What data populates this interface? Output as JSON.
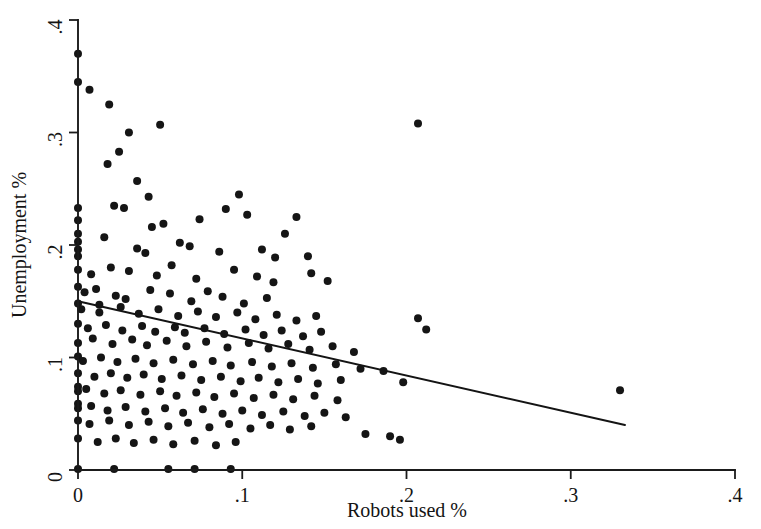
{
  "chart_data": {
    "type": "scatter",
    "title": "",
    "xlabel": "Robots used %",
    "ylabel": "Unemployment %",
    "xlim": [
      0,
      0.4
    ],
    "ylim": [
      0,
      0.4
    ],
    "xticks": [
      0,
      0.1,
      0.2,
      0.3,
      0.4
    ],
    "yticks": [
      0,
      0.1,
      0.2,
      0.3,
      0.4
    ],
    "xticklabels": [
      "0",
      ".1",
      ".2",
      ".3",
      ".4"
    ],
    "yticklabels": [
      "0",
      ".1",
      ".2",
      ".3",
      ".4"
    ],
    "grid": false,
    "legend": null,
    "marker_color": "#151515",
    "marker_size_px": 8,
    "line_color": "#141414",
    "fit_line": {
      "name": "linear fit",
      "x_start": 0.0,
      "y_start": 0.15,
      "x_end": 0.333,
      "y_end": 0.04,
      "slope": -0.33,
      "intercept": 0.15
    },
    "series": [
      {
        "name": "countries",
        "n_points": 196,
        "points": [
          [
            0.0,
            0.37
          ],
          [
            0.0,
            0.345
          ],
          [
            0.007,
            0.338
          ],
          [
            0.019,
            0.325
          ],
          [
            0.031,
            0.3
          ],
          [
            0.025,
            0.283
          ],
          [
            0.018,
            0.272
          ],
          [
            0.036,
            0.257
          ],
          [
            0.05,
            0.307
          ],
          [
            0.207,
            0.308
          ],
          [
            0.043,
            0.243
          ],
          [
            0.098,
            0.245
          ],
          [
            0.0,
            0.233
          ],
          [
            0.0,
            0.222
          ],
          [
            0.022,
            0.235
          ],
          [
            0.028,
            0.233
          ],
          [
            0.0,
            0.21
          ],
          [
            0.0,
            0.203
          ],
          [
            0.0,
            0.196
          ],
          [
            0.0,
            0.19
          ],
          [
            0.016,
            0.207
          ],
          [
            0.045,
            0.216
          ],
          [
            0.052,
            0.219
          ],
          [
            0.074,
            0.223
          ],
          [
            0.09,
            0.232
          ],
          [
            0.103,
            0.227
          ],
          [
            0.126,
            0.21
          ],
          [
            0.133,
            0.225
          ],
          [
            0.036,
            0.197
          ],
          [
            0.041,
            0.193
          ],
          [
            0.062,
            0.202
          ],
          [
            0.068,
            0.199
          ],
          [
            0.086,
            0.194
          ],
          [
            0.112,
            0.196
          ],
          [
            0.12,
            0.189
          ],
          [
            0.14,
            0.19
          ],
          [
            0.0,
            0.178
          ],
          [
            0.008,
            0.174
          ],
          [
            0.02,
            0.18
          ],
          [
            0.031,
            0.177
          ],
          [
            0.048,
            0.173
          ],
          [
            0.057,
            0.182
          ],
          [
            0.072,
            0.17
          ],
          [
            0.095,
            0.178
          ],
          [
            0.109,
            0.172
          ],
          [
            0.119,
            0.167
          ],
          [
            0.152,
            0.168
          ],
          [
            0.142,
            0.175
          ],
          [
            0.0,
            0.163
          ],
          [
            0.004,
            0.158
          ],
          [
            0.011,
            0.161
          ],
          [
            0.023,
            0.155
          ],
          [
            0.029,
            0.152
          ],
          [
            0.044,
            0.16
          ],
          [
            0.056,
            0.157
          ],
          [
            0.069,
            0.15
          ],
          [
            0.079,
            0.159
          ],
          [
            0.088,
            0.154
          ],
          [
            0.101,
            0.148
          ],
          [
            0.115,
            0.153
          ],
          [
            0.0,
            0.148
          ],
          [
            0.002,
            0.143
          ],
          [
            0.013,
            0.147
          ],
          [
            0.013,
            0.14
          ],
          [
            0.026,
            0.145
          ],
          [
            0.037,
            0.139
          ],
          [
            0.049,
            0.143
          ],
          [
            0.061,
            0.137
          ],
          [
            0.073,
            0.141
          ],
          [
            0.084,
            0.136
          ],
          [
            0.097,
            0.14
          ],
          [
            0.108,
            0.134
          ],
          [
            0.121,
            0.138
          ],
          [
            0.133,
            0.133
          ],
          [
            0.145,
            0.137
          ],
          [
            0.207,
            0.135
          ],
          [
            0.212,
            0.125
          ],
          [
            0.0,
            0.13
          ],
          [
            0.006,
            0.126
          ],
          [
            0.017,
            0.129
          ],
          [
            0.027,
            0.124
          ],
          [
            0.039,
            0.128
          ],
          [
            0.047,
            0.123
          ],
          [
            0.059,
            0.127
          ],
          [
            0.065,
            0.122
          ],
          [
            0.077,
            0.126
          ],
          [
            0.089,
            0.121
          ],
          [
            0.102,
            0.125
          ],
          [
            0.113,
            0.12
          ],
          [
            0.124,
            0.124
          ],
          [
            0.137,
            0.119
          ],
          [
            0.148,
            0.123
          ],
          [
            0.0,
            0.113
          ],
          [
            0.009,
            0.117
          ],
          [
            0.021,
            0.112
          ],
          [
            0.033,
            0.116
          ],
          [
            0.042,
            0.111
          ],
          [
            0.054,
            0.115
          ],
          [
            0.066,
            0.11
          ],
          [
            0.078,
            0.114
          ],
          [
            0.091,
            0.109
          ],
          [
            0.104,
            0.113
          ],
          [
            0.116,
            0.108
          ],
          [
            0.128,
            0.112
          ],
          [
            0.141,
            0.107
          ],
          [
            0.155,
            0.11
          ],
          [
            0.168,
            0.105
          ],
          [
            0.0,
            0.101
          ],
          [
            0.003,
            0.097
          ],
          [
            0.014,
            0.1
          ],
          [
            0.024,
            0.096
          ],
          [
            0.035,
            0.099
          ],
          [
            0.046,
            0.095
          ],
          [
            0.058,
            0.098
          ],
          [
            0.07,
            0.094
          ],
          [
            0.082,
            0.097
          ],
          [
            0.093,
            0.093
          ],
          [
            0.106,
            0.096
          ],
          [
            0.118,
            0.092
          ],
          [
            0.13,
            0.095
          ],
          [
            0.143,
            0.091
          ],
          [
            0.157,
            0.094
          ],
          [
            0.172,
            0.09
          ],
          [
            0.186,
            0.088
          ],
          [
            0.198,
            0.078
          ],
          [
            0.33,
            0.071
          ],
          [
            0.0,
            0.086
          ],
          [
            0.01,
            0.083
          ],
          [
            0.02,
            0.086
          ],
          [
            0.03,
            0.082
          ],
          [
            0.04,
            0.085
          ],
          [
            0.051,
            0.081
          ],
          [
            0.063,
            0.084
          ],
          [
            0.075,
            0.08
          ],
          [
            0.087,
            0.083
          ],
          [
            0.099,
            0.079
          ],
          [
            0.11,
            0.082
          ],
          [
            0.122,
            0.078
          ],
          [
            0.134,
            0.081
          ],
          [
            0.146,
            0.077
          ],
          [
            0.16,
            0.08
          ],
          [
            0.0,
            0.074
          ],
          [
            0.0,
            0.07
          ],
          [
            0.005,
            0.072
          ],
          [
            0.016,
            0.068
          ],
          [
            0.026,
            0.071
          ],
          [
            0.038,
            0.067
          ],
          [
            0.05,
            0.07
          ],
          [
            0.06,
            0.066
          ],
          [
            0.072,
            0.069
          ],
          [
            0.083,
            0.065
          ],
          [
            0.095,
            0.068
          ],
          [
            0.107,
            0.064
          ],
          [
            0.119,
            0.067
          ],
          [
            0.131,
            0.063
          ],
          [
            0.144,
            0.066
          ],
          [
            0.158,
            0.062
          ],
          [
            0.0,
            0.059
          ],
          [
            0.0,
            0.055
          ],
          [
            0.008,
            0.057
          ],
          [
            0.018,
            0.053
          ],
          [
            0.029,
            0.056
          ],
          [
            0.041,
            0.052
          ],
          [
            0.053,
            0.055
          ],
          [
            0.064,
            0.051
          ],
          [
            0.076,
            0.054
          ],
          [
            0.088,
            0.05
          ],
          [
            0.1,
            0.053
          ],
          [
            0.112,
            0.049
          ],
          [
            0.125,
            0.052
          ],
          [
            0.138,
            0.048
          ],
          [
            0.15,
            0.051
          ],
          [
            0.163,
            0.047
          ],
          [
            0.175,
            0.032
          ],
          [
            0.19,
            0.03
          ],
          [
            0.196,
            0.027
          ],
          [
            0.0,
            0.044
          ],
          [
            0.007,
            0.041
          ],
          [
            0.019,
            0.044
          ],
          [
            0.031,
            0.04
          ],
          [
            0.043,
            0.043
          ],
          [
            0.055,
            0.039
          ],
          [
            0.067,
            0.042
          ],
          [
            0.08,
            0.038
          ],
          [
            0.092,
            0.041
          ],
          [
            0.105,
            0.037
          ],
          [
            0.117,
            0.04
          ],
          [
            0.129,
            0.036
          ],
          [
            0.142,
            0.039
          ],
          [
            0.0,
            0.028
          ],
          [
            0.012,
            0.025
          ],
          [
            0.023,
            0.028
          ],
          [
            0.034,
            0.024
          ],
          [
            0.046,
            0.027
          ],
          [
            0.058,
            0.023
          ],
          [
            0.071,
            0.026
          ],
          [
            0.084,
            0.022
          ],
          [
            0.096,
            0.025
          ],
          [
            0.0,
            0.001
          ],
          [
            0.022,
            0.001
          ],
          [
            0.055,
            0.001
          ],
          [
            0.071,
            0.001
          ],
          [
            0.093,
            0.001
          ]
        ]
      }
    ]
  }
}
